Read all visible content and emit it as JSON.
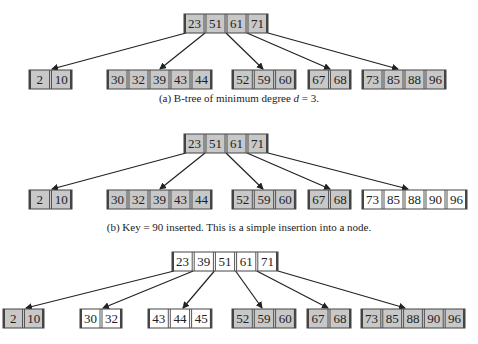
{
  "colors": {
    "filled": "#c8c8c8",
    "empty": "#ffffff",
    "border": "#444444",
    "divider": "#555555",
    "arrow": "#222222",
    "text": "#222222"
  },
  "diagrams": [
    {
      "id": "a",
      "caption": "(a) B-tree of minimum degree d = 3.",
      "caption_parts": [
        "(a) B-tree of minimum degree ",
        "d",
        " = 3."
      ],
      "caption_y": 98,
      "root": {
        "x": 184,
        "y": 14,
        "cell_w": 21,
        "h": 19,
        "keys": [
          "23",
          "51",
          "61",
          "71"
        ],
        "shaded": true
      },
      "leaves": [
        {
          "x": 29,
          "y": 70,
          "cell_w": 21.5,
          "h": 19,
          "keys": [
            "2",
            "10"
          ],
          "shaded": true
        },
        {
          "x": 107,
          "y": 70,
          "cell_w": 21,
          "h": 19,
          "keys": [
            "30",
            "32",
            "39",
            "43",
            "44"
          ],
          "shaded": true
        },
        {
          "x": 232,
          "y": 70,
          "cell_w": 21.3,
          "h": 19,
          "keys": [
            "52",
            "59",
            "60"
          ],
          "shaded": true
        },
        {
          "x": 308,
          "y": 70,
          "cell_w": 21.5,
          "h": 19,
          "keys": [
            "67",
            "68"
          ],
          "shaded": true
        },
        {
          "x": 362,
          "y": 70,
          "cell_w": 21,
          "h": 19,
          "keys": [
            "73",
            "85",
            "88",
            "96"
          ],
          "shaded": true
        }
      ],
      "edges": [
        [
          0,
          52
        ],
        [
          1,
          160
        ],
        [
          2,
          263
        ],
        [
          3,
          330
        ],
        [
          4,
          398
        ]
      ]
    },
    {
      "id": "b",
      "caption": "(b) Key = 90 inserted. This is a simple insertion into a node.",
      "caption_parts": [
        "(b) Key = 90 inserted. This is a simple insertion into a node.",
        "",
        ""
      ],
      "caption_y": 227,
      "root": {
        "x": 184,
        "y": 134,
        "cell_w": 21,
        "h": 19,
        "keys": [
          "23",
          "51",
          "61",
          "71"
        ],
        "shaded": true
      },
      "leaves": [
        {
          "x": 29,
          "y": 190,
          "cell_w": 21.5,
          "h": 19,
          "keys": [
            "2",
            "10"
          ],
          "shaded": true
        },
        {
          "x": 107,
          "y": 190,
          "cell_w": 21,
          "h": 19,
          "keys": [
            "30",
            "32",
            "39",
            "43",
            "44"
          ],
          "shaded": true
        },
        {
          "x": 232,
          "y": 190,
          "cell_w": 21.3,
          "h": 19,
          "keys": [
            "52",
            "59",
            "60"
          ],
          "shaded": true
        },
        {
          "x": 308,
          "y": 190,
          "cell_w": 21.5,
          "h": 19,
          "keys": [
            "67",
            "68"
          ],
          "shaded": true
        },
        {
          "x": 362,
          "y": 190,
          "cell_w": 21,
          "h": 19,
          "keys": [
            "73",
            "85",
            "88",
            "90",
            "96"
          ],
          "shaded": false
        }
      ],
      "edges": [
        [
          0,
          52
        ],
        [
          1,
          160
        ],
        [
          2,
          263
        ],
        [
          3,
          330
        ],
        [
          4,
          408
        ]
      ]
    },
    {
      "id": "c",
      "caption": "",
      "caption_parts": [
        "",
        "",
        ""
      ],
      "caption_y": 0,
      "root": {
        "x": 172,
        "y": 252,
        "cell_w": 21.2,
        "h": 19,
        "keys": [
          "23",
          "39",
          "51",
          "61",
          "71"
        ],
        "shaded": false
      },
      "leaves": [
        {
          "x": 3,
          "y": 309,
          "cell_w": 20.5,
          "h": 19,
          "keys": [
            "2",
            "10"
          ],
          "shaded": true
        },
        {
          "x": 80,
          "y": 309,
          "cell_w": 21,
          "h": 19,
          "keys": [
            "30",
            "32"
          ],
          "shaded": false
        },
        {
          "x": 148,
          "y": 309,
          "cell_w": 21.3,
          "h": 19,
          "keys": [
            "43",
            "44",
            "45"
          ],
          "shaded": false
        },
        {
          "x": 232,
          "y": 309,
          "cell_w": 21.3,
          "h": 19,
          "keys": [
            "52",
            "59",
            "60"
          ],
          "shaded": true
        },
        {
          "x": 307,
          "y": 309,
          "cell_w": 22,
          "h": 19,
          "keys": [
            "67",
            "68"
          ],
          "shaded": true
        },
        {
          "x": 361,
          "y": 309,
          "cell_w": 20.8,
          "h": 19,
          "keys": [
            "73",
            "85",
            "88",
            "90",
            "96"
          ],
          "shaded": true
        }
      ],
      "edges": [
        [
          0,
          26
        ],
        [
          1,
          103
        ],
        [
          2,
          183
        ],
        [
          3,
          262
        ],
        [
          4,
          328
        ],
        [
          5,
          405
        ]
      ]
    }
  ]
}
